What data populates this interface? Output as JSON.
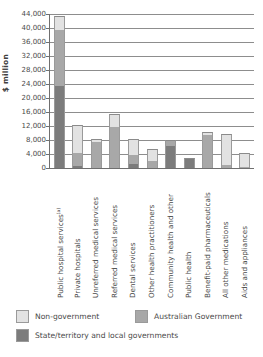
{
  "chart_data": {
    "type": "bar",
    "subtype": "stacked-vertical",
    "title": "",
    "xlabel": "",
    "ylabel": "$ million",
    "ylim": [
      0,
      44000
    ],
    "ytick_step": 4000,
    "ytick_labels": [
      "44,000",
      "40,000",
      "36,000",
      "32,000",
      "28,000",
      "24,000",
      "20,000",
      "16,000",
      "12,000",
      "8,000",
      "4,000",
      "0"
    ],
    "grid": true,
    "legend_position": "bottom-left",
    "categories": [
      "Public hospital services",
      "Private hospitals",
      "Unreferred medical services",
      "Referred medical services",
      "Dental services",
      "Other health practitioners",
      "Community health and other",
      "Public health",
      "Benefit-paid pharmaceuticals",
      "All other medications",
      "Aids and appliances"
    ],
    "category_footnotes": [
      "(a)",
      "",
      "",
      "",
      "",
      "",
      "",
      "",
      "",
      "",
      ""
    ],
    "series": [
      {
        "name": "State/territory and local governments",
        "color": "#7c7c7c",
        "values": [
          23500,
          600,
          0,
          0,
          1200,
          0,
          6200,
          2900,
          0,
          0,
          0
        ]
      },
      {
        "name": "Australian Government",
        "color": "#a8a8a8",
        "values": [
          16000,
          3600,
          7300,
          11600,
          2400,
          1900,
          1700,
          0,
          9400,
          800,
          200
        ]
      },
      {
        "name": "Non-government",
        "color": "#e2e2e2",
        "values": [
          4000,
          8000,
          1100,
          3700,
          4600,
          3500,
          0,
          0,
          800,
          9000,
          4200
        ]
      }
    ],
    "totals": [
      43500,
      12200,
      8400,
      15300,
      8200,
      5400,
      7900,
      2900,
      10200,
      9800,
      4400
    ]
  },
  "legend": {
    "items": [
      {
        "label": "Non-government",
        "color": "#e2e2e2"
      },
      {
        "label": "Australian Government",
        "color": "#a8a8a8"
      },
      {
        "label": "State/territory and local governments",
        "color": "#7c7c7c"
      }
    ]
  }
}
